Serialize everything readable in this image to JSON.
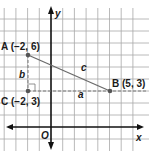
{
  "diagram": {
    "type": "coordinate-plane",
    "axes": {
      "x_label": "x",
      "y_label": "y",
      "origin_label": "O"
    },
    "points": [
      {
        "name": "A",
        "label": "A (−2, 6)",
        "x": -2,
        "y": 6
      },
      {
        "name": "B",
        "label": "B (5, 3)",
        "x": 5,
        "y": 3
      },
      {
        "name": "C",
        "label": "C (−2, 3)",
        "x": -2,
        "y": 3
      }
    ],
    "segments": [
      {
        "from": "A",
        "to": "B",
        "label": "c",
        "style": "solid"
      },
      {
        "from": "C",
        "to": "B",
        "label": "a",
        "style": "dashed"
      },
      {
        "from": "A",
        "to": "C",
        "label": "b",
        "style": "dashed"
      }
    ],
    "right_angle_at": "C",
    "colors": {
      "grid": "#9a9a9a",
      "axis": "#111111",
      "segment": "#6a6a6a",
      "point": "#555555"
    }
  }
}
